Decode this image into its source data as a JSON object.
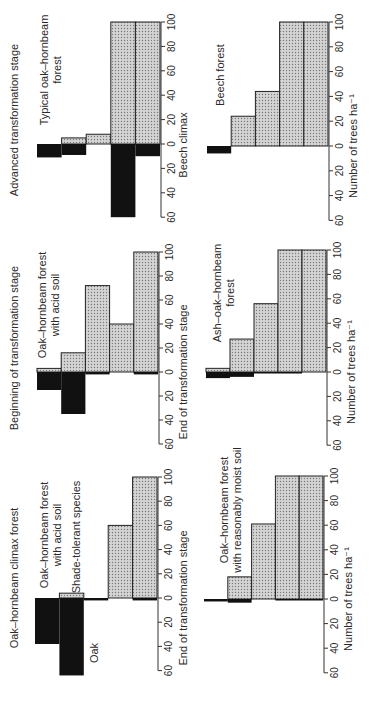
{
  "figure": {
    "orientation": "rotated-90-ccw",
    "colors": {
      "oak": "#111111",
      "shade_tolerant": "#cfcfcf",
      "shade_dots": "#7a7a7a",
      "outline": "#222222",
      "axis": "#333333"
    },
    "stage_labels": [
      "Advanced transformation stage",
      "Beginning of transformation stage",
      "Oak–hornbeam climax forest"
    ],
    "legend": {
      "oak": "Oak",
      "shade_tolerant": "Shade-tolerant species"
    }
  },
  "chart_data": [
    {
      "type": "bar",
      "panel": "top-left",
      "title": "Typical oak–hornbeam forest",
      "xlabel": "Beech climax",
      "axis_ticks": [
        "60",
        "40",
        "20",
        "0",
        "20",
        "40",
        "60",
        "80",
        "100"
      ],
      "ylim": [
        -60,
        100
      ],
      "categories": [
        "1",
        "2",
        "3",
        "4",
        "5"
      ],
      "series": [
        {
          "name": "Shade-tolerant species",
          "values": [
            0,
            5,
            8,
            100,
            100
          ]
        },
        {
          "name": "Oak",
          "values": [
            11,
            9,
            0,
            60,
            10
          ]
        }
      ]
    },
    {
      "type": "bar",
      "panel": "top-right",
      "title": "Beech forest",
      "xlabel": "Number of trees ha⁻¹",
      "axis_ticks": [
        "60",
        "40",
        "20",
        "0",
        "20",
        "40",
        "60",
        "80",
        "100"
      ],
      "ylim": [
        -60,
        100
      ],
      "categories": [
        "1",
        "2",
        "3",
        "4",
        "5"
      ],
      "series": [
        {
          "name": "Shade-tolerant species",
          "values": [
            0,
            24,
            44,
            100,
            100
          ]
        },
        {
          "name": "Oak",
          "values": [
            6,
            0,
            0,
            0,
            0
          ]
        }
      ]
    },
    {
      "type": "bar",
      "panel": "middle-left",
      "title": "Oak–hornbeam forest with acid soil",
      "xlabel": "End of transformation stage",
      "axis_ticks": [
        "60",
        "40",
        "20",
        "0",
        "20",
        "40",
        "60",
        "80",
        "100"
      ],
      "ylim": [
        -60,
        100
      ],
      "categories": [
        "1",
        "2",
        "3",
        "4",
        "5"
      ],
      "series": [
        {
          "name": "Shade-tolerant species",
          "values": [
            3,
            16,
            72,
            40,
            100
          ]
        },
        {
          "name": "Oak",
          "values": [
            15,
            35,
            2,
            0,
            2
          ]
        }
      ]
    },
    {
      "type": "bar",
      "panel": "middle-right",
      "title": "Ash–oak–hornbeam forest",
      "xlabel": "Number of trees ha⁻¹",
      "axis_ticks": [
        "60",
        "40",
        "20",
        "0",
        "20",
        "40",
        "60",
        "80",
        "100"
      ],
      "ylim": [
        -60,
        100
      ],
      "categories": [
        "1",
        "2",
        "3",
        "4",
        "5"
      ],
      "series": [
        {
          "name": "Shade-tolerant species",
          "values": [
            3,
            27,
            56,
            100,
            100
          ]
        },
        {
          "name": "Oak",
          "values": [
            5,
            4,
            1,
            1,
            0
          ]
        }
      ]
    },
    {
      "type": "bar",
      "panel": "bottom-left",
      "title": "Oak–hornbeam forest with acid soil",
      "xlabel": "End of transformation stage",
      "axis_ticks": [
        "60",
        "40",
        "20",
        "0",
        "20",
        "40",
        "60",
        "80",
        "100"
      ],
      "ylim": [
        -60,
        100
      ],
      "categories": [
        "1",
        "2",
        "3",
        "4",
        "5"
      ],
      "series": [
        {
          "name": "Shade-tolerant species",
          "values": [
            0,
            4,
            0,
            60,
            100
          ]
        },
        {
          "name": "Oak",
          "values": [
            38,
            64,
            2,
            0,
            2
          ]
        }
      ]
    },
    {
      "type": "bar",
      "panel": "bottom-right",
      "title": "Oak–hornbeam forest with reasonably moist soil",
      "xlabel": "Number of trees ha⁻¹",
      "axis_ticks": [
        "60",
        "40",
        "20",
        "0",
        "20",
        "40",
        "60",
        "80",
        "100"
      ],
      "ylim": [
        -60,
        100
      ],
      "categories": [
        "1",
        "2",
        "3",
        "4",
        "5"
      ],
      "series": [
        {
          "name": "Shade-tolerant species",
          "values": [
            0,
            18,
            61,
            100,
            100
          ]
        },
        {
          "name": "Oak",
          "values": [
            2,
            3,
            0,
            1,
            1
          ]
        }
      ]
    }
  ],
  "text": {
    "title_top_left_1": "Typical oak–hornbeam",
    "title_top_left_2": "forest",
    "title_top_right": "Beech forest",
    "title_mid_left_1": "Oak–hornbeam forest",
    "title_mid_left_2": "with acid soil",
    "title_mid_right_1": "Ash–oak–hornbeam",
    "title_mid_right_2": "forest",
    "title_bot_left_1": "Oak–hornbeam forest",
    "title_bot_left_2": "with acid soil",
    "title_bot_right_1": "Oak–hornbeam forest",
    "title_bot_right_2": "with reasonably moist soil",
    "xlabel_top_left": "Beech climax",
    "xlabel_mid_left": "End of transformation stage",
    "xlabel_bot_left": "End of transformation stage",
    "xlabel_right": "Number of trees ha⁻¹"
  }
}
